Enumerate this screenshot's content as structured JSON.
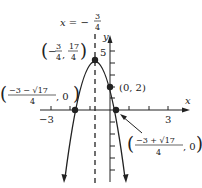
{
  "diagram": {
    "type": "parabola graph",
    "equation_label": "x = −3/4",
    "axis_of_symmetry": {
      "prefix": "x = −",
      "num": "3",
      "den": "4"
    },
    "axes": {
      "x_label": "x",
      "y_label": "y",
      "x_ticks": [
        "−3",
        "3"
      ],
      "y_ticks": [
        "5"
      ]
    },
    "points": {
      "vertex": {
        "label": "(−3/4, 17/4)"
      },
      "y_intercept": {
        "label": "(0, 2)"
      },
      "left_root": {
        "label": "((−3 − √17)/4, 0)"
      },
      "right_root": {
        "label": "((−3 + √17)/4, 0)"
      }
    },
    "text": {
      "vertex_a": "3",
      "vertex_b": "4",
      "vertex_c": "17",
      "vertex_d": "4",
      "yint": "(0, 2)",
      "lr_num": "−3 − √17",
      "lr_den": "4",
      "lr_tail": ", 0",
      "rr_num": "−3 + √17",
      "rr_den": "4",
      "rr_tail": ", 0",
      "xm3": "−3",
      "x3": "3",
      "y5": "5",
      "xl": "x",
      "yl": "y"
    }
  }
}
